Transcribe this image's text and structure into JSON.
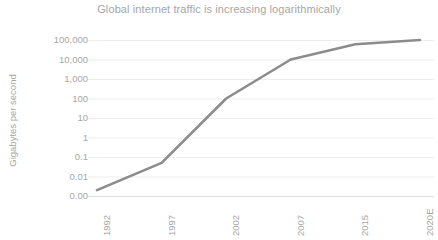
{
  "chart_data": {
    "type": "line",
    "title": "Global internet traffic is increasing logarithmically",
    "xlabel": "",
    "ylabel": "Gigabytes per second",
    "categories": [
      "1992",
      "1997",
      "2002",
      "2007",
      "2015",
      "2020E"
    ],
    "values": [
      0.002,
      0.05,
      100,
      10000,
      60000,
      100000
    ],
    "y_tick_labels": [
      "100,000",
      "10,000",
      "1,000",
      "100",
      "10",
      "1",
      "0.1",
      "0.01",
      "0.00"
    ],
    "y_scale": "log",
    "ylim": [
      0.001,
      100000
    ],
    "grid": true,
    "grid_axis": "y",
    "legend": false,
    "legend_position": "none",
    "series": [
      {
        "name": "Global internet traffic",
        "color": "#8c8c8c",
        "values": [
          0.002,
          0.05,
          100,
          10000,
          60000,
          100000
        ]
      }
    ]
  },
  "style": {
    "line_color": "#8c8c8c",
    "text_color": "#a6a6a6",
    "grid_color": "#ededed",
    "axis_color": "#e0e0e0",
    "background": "#ffffff"
  }
}
